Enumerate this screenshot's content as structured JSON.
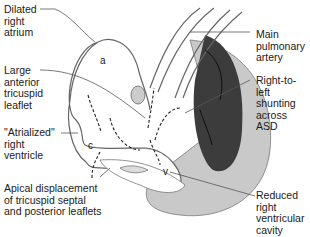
{
  "diagram": {
    "labels": {
      "dilated_ra": "Dilated\nright\natrium",
      "large_leaflet": "Large\nanterior\ntricuspid\nleaflet",
      "atrialized_rv": "\"Atrialized\"\nright\nventricle",
      "apical_displacement": "Apical displacement\nof tricuspid septal\nand posterior leaflets",
      "main_pa": "Main\npulmonary\nartery",
      "shunt": "Right-to-left\nshunting\nacross\nASD",
      "reduced_rv": "Reduced\nright\nventricular\ncavity"
    },
    "chambers": {
      "a": "a",
      "c": "c",
      "v": "v"
    },
    "colors": {
      "lv_dark": "#3a3a3a",
      "myocardium": "#c8c8c8",
      "outline": "#555555"
    }
  }
}
